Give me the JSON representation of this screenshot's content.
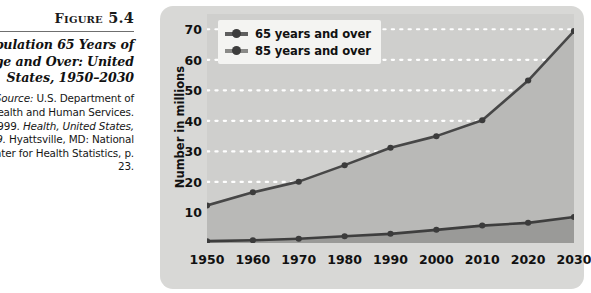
{
  "figure": {
    "label": "Figure 5.4",
    "title": "Population 65 Years of Age and Over: United States, 1950–2030",
    "source_prefix": "Source:",
    "source_text": " U.S. Department of Health and Human Services. 1999. ",
    "source_italic": "Health, United States, 1999.",
    "source_tail": " Hyattsville, MD: National Center for Health Statistics, p. 23."
  },
  "legend": {
    "position": "top-left-inside",
    "items": [
      {
        "label": "65 years and over",
        "color": "#5f5f5f"
      },
      {
        "label": "85 years and over",
        "color": "#7d7d7d"
      }
    ]
  },
  "colors": {
    "panel_bg": "#d8d8d6",
    "plot_bg": "#cfcfcd",
    "gridline": "#ffffff",
    "series_65_line": "#474747",
    "series_65_fill": "#b9b9b7",
    "series_85_line": "#3e3e3e",
    "series_85_fill": "#9a9a98",
    "axis_text": "#111111"
  },
  "chart_data": {
    "type": "line",
    "title": "Population 65 Years of Age and Over: United States, 1950–2030",
    "xlabel": "",
    "ylabel": "Number in millions",
    "x": [
      1950,
      1960,
      1970,
      1980,
      1990,
      2000,
      2010,
      2020,
      2030
    ],
    "xtick_labels": [
      "1950",
      "1960",
      "1970",
      "1980",
      "1990",
      "2000",
      "2010",
      "2020",
      "2030"
    ],
    "ytick_labels": [
      "10",
      "20",
      "30",
      "40",
      "50",
      "60",
      "70"
    ],
    "yticks": [
      10,
      20,
      30,
      40,
      50,
      60,
      70
    ],
    "ylim": [
      0,
      75
    ],
    "xlim": [
      1950,
      2030
    ],
    "grid": true,
    "grid_style": "dotted-horizontal-white",
    "markers": true,
    "area_filled": true,
    "series": [
      {
        "name": "65 years and over",
        "color": "#474747",
        "values": [
          12.3,
          16.6,
          20.1,
          25.5,
          31.2,
          35.0,
          40.2,
          53.2,
          69.4
        ]
      },
      {
        "name": "85 years and over",
        "color": "#3e3e3e",
        "values": [
          0.6,
          0.9,
          1.4,
          2.2,
          3.0,
          4.3,
          5.7,
          6.6,
          8.5
        ]
      }
    ]
  }
}
